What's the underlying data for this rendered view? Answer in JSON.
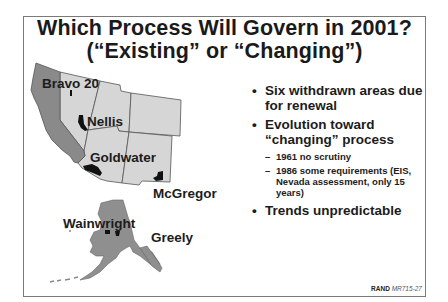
{
  "slide": {
    "title_line1": "Which Process Will Govern in 2001?",
    "title_line2": "(“Existing” or “Changing”)"
  },
  "map": {
    "labels": {
      "bravo": "Bravo 20",
      "nellis": "Nellis",
      "goldwater": "Goldwater",
      "mcgregor": "McGregor",
      "wainwright": "Wainwright",
      "greely": "Greely"
    },
    "colors": {
      "california": "#8a8a8a",
      "other_states": "#d6d6d6",
      "alaska": "#8f8f8f",
      "withdrawn_area": "#111111",
      "border": "#555555"
    }
  },
  "bullets": [
    {
      "text": "Six withdrawn areas due for renewal",
      "line1": "Six withdrawn areas due",
      "line2": "for renewal"
    },
    {
      "text": "Evolution toward “changing” process",
      "line1": "Evolution toward",
      "line2": "“changing” process",
      "subs": [
        {
          "line1": "1961 no scrutiny"
        },
        {
          "line1": "1986 some requirements (EIS,",
          "line2": "Nevada assessment, only 15",
          "line3": "years)"
        }
      ]
    },
    {
      "text": "Trends unpredictable",
      "line1": "Trends unpredictable"
    }
  ],
  "bullet_glyph": "•",
  "dash_glyph": "–",
  "footer": {
    "org": "RAND",
    "code": "MR715-27"
  }
}
